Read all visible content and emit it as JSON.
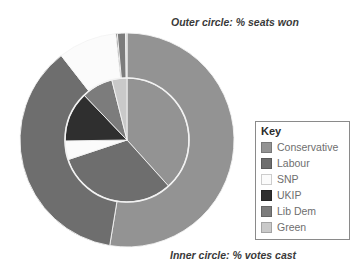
{
  "labels": {
    "outer_title": "Outer circle: % seats won",
    "inner_title": "Inner circle: % votes cast"
  },
  "legend": {
    "title": "Key",
    "items": [
      {
        "label": "Conservative",
        "color": "#939393"
      },
      {
        "label": "Labour",
        "color": "#6e6e6e"
      },
      {
        "label": "SNP",
        "color": "#fbfbfb"
      },
      {
        "label": "UKIP",
        "color": "#2f2f2f"
      },
      {
        "label": "Lib Dem",
        "color": "#7c7c7c"
      },
      {
        "label": "Green",
        "color": "#c9c9c9"
      }
    ]
  },
  "chart_data": {
    "type": "pie",
    "legend_position": "right",
    "center": {
      "x": 127,
      "y": 140
    },
    "radii": {
      "outer": 107,
      "inner": 62
    },
    "start_angle_deg": -90,
    "direction": "clockwise",
    "categories": [
      "Conservative",
      "Labour",
      "SNP",
      "UKIP",
      "Lib Dem",
      "Green"
    ],
    "colors": [
      "#939393",
      "#6e6e6e",
      "#fbfbfb",
      "#2f2f2f",
      "#7c7c7c",
      "#c9c9c9"
    ],
    "series": [
      {
        "name": "Outer circle: % seats won",
        "ring": "outer",
        "unit": "%",
        "values": [
          50.9,
          35.7,
          8.6,
          0.2,
          1.2,
          0.2
        ]
      },
      {
        "name": "Inner circle: % votes cast",
        "ring": "inner",
        "unit": "%",
        "values": [
          36.9,
          30.4,
          4.7,
          12.6,
          7.9,
          3.8
        ]
      }
    ]
  }
}
